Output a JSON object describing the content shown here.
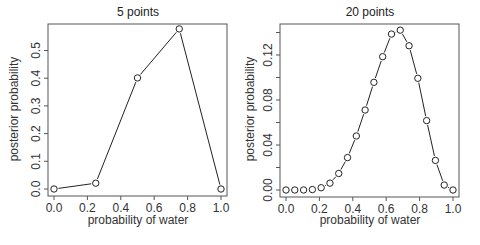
{
  "chart_data": [
    {
      "type": "line",
      "title": "5 points",
      "xlabel": "probability of water",
      "ylabel": "posterior probability",
      "x": [
        0.0,
        0.25,
        0.5,
        0.75,
        1.0
      ],
      "series": [
        {
          "name": "posterior",
          "values": [
            0.0,
            0.021,
            0.401,
            0.578,
            0.0
          ],
          "marker": "open-circle"
        }
      ],
      "xticks": [
        "0.0",
        "0.2",
        "0.4",
        "0.6",
        "0.8",
        "1.0"
      ],
      "yticks": [
        "0.0",
        "0.1",
        "0.2",
        "0.3",
        "0.4",
        "0.5"
      ],
      "xlim": [
        0,
        1
      ],
      "ylim": [
        0,
        0.578
      ],
      "grid": false,
      "legend": null
    },
    {
      "type": "line",
      "title": "20 points",
      "xlabel": "probability of water",
      "ylabel": "posterior probability",
      "x": [
        0.0,
        0.0526,
        0.1053,
        0.1579,
        0.2105,
        0.2632,
        0.3158,
        0.3684,
        0.4211,
        0.4737,
        0.5263,
        0.5789,
        0.6316,
        0.6842,
        0.7368,
        0.7895,
        0.8421,
        0.8947,
        0.9474,
        1.0
      ],
      "series": [
        {
          "name": "posterior",
          "values": [
            0.0,
            0.0,
            4e-05,
            0.0004,
            0.002,
            0.0061,
            0.0147,
            0.0288,
            0.048,
            0.0711,
            0.0957,
            0.1185,
            0.1386,
            0.1421,
            0.1282,
            0.0993,
            0.0617,
            0.0263,
            0.0044,
            0.0
          ],
          "marker": "open-circle"
        }
      ],
      "xticks": [
        "0.0",
        "0.2",
        "0.4",
        "0.6",
        "0.8",
        "1.0"
      ],
      "yticks": [
        "0.00",
        "0.04",
        "0.08",
        "0.12"
      ],
      "xlim": [
        0,
        1
      ],
      "ylim": [
        0,
        0.1421
      ],
      "grid": false,
      "legend": null
    }
  ],
  "left": {
    "title": "5 points",
    "xlabel": "probability of water",
    "ylabel": "posterior probability"
  },
  "right": {
    "title": "20 points",
    "xlabel": "probability of water",
    "ylabel": "posterior probability"
  }
}
